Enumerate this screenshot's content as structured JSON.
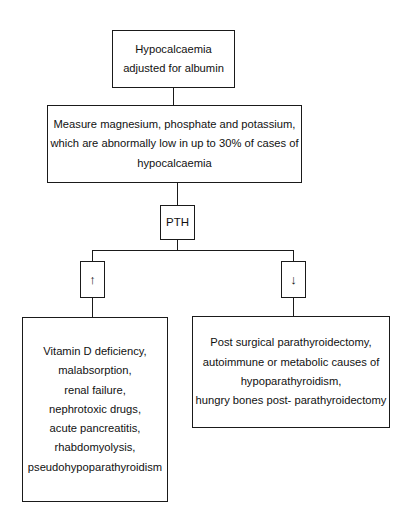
{
  "diagram": {
    "colors": {
      "background": "#ffffff",
      "border": "#1a1a1a",
      "text": "#111111"
    },
    "nodes": {
      "start": {
        "lines": [
          "Hypocalcaemia",
          "adjusted for albumin"
        ]
      },
      "measure": {
        "lines": [
          "Measure magnesium, phosphate and potassium,",
          "which are abnormally low in up to 30% of cases of",
          "hypocalcaemia"
        ]
      },
      "pth": {
        "label": "PTH"
      },
      "pth_high": {
        "glyph": "↑",
        "meaning": "raised PTH"
      },
      "pth_low": {
        "glyph": "↓",
        "meaning": "low PTH"
      },
      "high_causes": {
        "lines": [
          "Vitamin D deficiency,",
          "malabsorption,",
          "renal failure,",
          "nephrotoxic drugs,",
          "acute pancreatitis,",
          "rhabdomyolysis,",
          "pseudohypoparathyroidism"
        ]
      },
      "low_causes": {
        "lines": [
          "Post surgical parathyroidectomy,",
          "autoimmune or metabolic causes of",
          "hypoparathyroidism,",
          "hungry bones post- parathyroidectomy"
        ]
      }
    }
  }
}
